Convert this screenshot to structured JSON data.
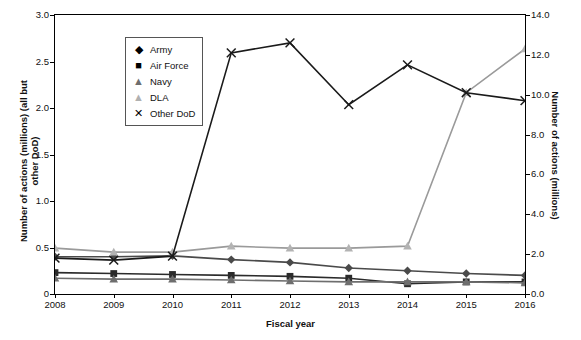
{
  "chart_data": {
    "type": "line",
    "title": "",
    "xlabel": "Fiscal year",
    "ylabel_left": "Number of actions (millions) (all but other DoD)",
    "ylabel_right": "Number of actions (millions)",
    "categories": [
      "2008",
      "2009",
      "2010",
      "2011",
      "2012",
      "2013",
      "2014",
      "2015",
      "2016"
    ],
    "x": [
      2008,
      2009,
      2010,
      2011,
      2012,
      2013,
      2014,
      2015,
      2016
    ],
    "ylim_left": [
      0,
      3.0
    ],
    "ylim_right": [
      0,
      14.0
    ],
    "yticks_left": [
      "0",
      "0.5",
      "1.0",
      "1.5",
      "2.0",
      "2.5",
      "3.0"
    ],
    "yticks_right": [
      "0.0",
      "2.0",
      "4.0",
      "6.0",
      "8.0",
      "10.0",
      "12.0",
      "14.0"
    ],
    "grid": false,
    "legend_position": "top-left",
    "series": [
      {
        "name": "Army",
        "marker": "diamond",
        "axis": "left",
        "color": "#4a4a4a",
        "values": [
          0.4,
          0.4,
          0.41,
          0.37,
          0.34,
          0.28,
          0.25,
          0.22,
          0.2
        ]
      },
      {
        "name": "Air Force",
        "marker": "square",
        "axis": "left",
        "color": "#2b2b2b",
        "values": [
          0.23,
          0.22,
          0.21,
          0.2,
          0.19,
          0.17,
          0.11,
          0.13,
          0.13
        ]
      },
      {
        "name": "Navy",
        "marker": "triangle",
        "axis": "left",
        "color": "#6e6e6e",
        "values": [
          0.17,
          0.16,
          0.16,
          0.15,
          0.14,
          0.13,
          0.13,
          0.13,
          0.12
        ]
      },
      {
        "name": "DLA",
        "marker": "triangle-light",
        "axis": "right",
        "color": "#9a9a9a",
        "values": [
          2.3,
          2.1,
          2.1,
          2.4,
          2.3,
          2.3,
          2.4,
          10.1,
          12.3
        ]
      },
      {
        "name": "Other DoD",
        "marker": "x",
        "axis": "right",
        "color": "#1a1a1a",
        "values": [
          1.8,
          1.7,
          1.9,
          12.1,
          12.6,
          9.5,
          11.5,
          10.1,
          9.7
        ]
      }
    ]
  },
  "legend": {
    "items": [
      {
        "label": "Army",
        "marker": "◆"
      },
      {
        "label": "Air Force",
        "marker": "■"
      },
      {
        "label": "Navy",
        "marker": "▲"
      },
      {
        "label": "DLA",
        "marker": "▲"
      },
      {
        "label": "Other DoD",
        "marker": "✕"
      }
    ]
  }
}
